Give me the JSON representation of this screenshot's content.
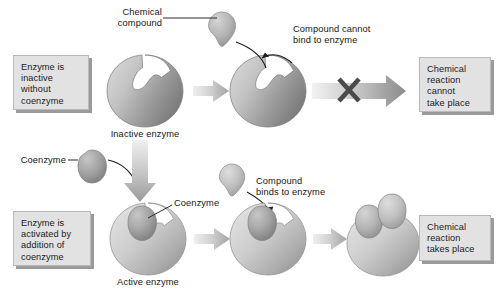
{
  "diagram": {
    "colors": {
      "box_fill": "#e2e2e2",
      "box_border": "#b9b9b9",
      "box_shadow": "#9a9a9a",
      "enzyme_light": "#d8d8d8",
      "enzyme_dark": "#8d8d8d",
      "coenzyme_dark": "#9c9c9c",
      "compound_gray": "#b5b5b5",
      "arrow_light": "#eeeeee",
      "arrow_dark": "#8a8a8a",
      "cross_mark": "#4d4d4d",
      "text": "#171717",
      "background": "#ffffff"
    },
    "top_row": {
      "left_box": "Enzyme is\ninactive\nwithout\ncoenzyme",
      "compound_label": "Chemical\ncompound",
      "enzyme_caption": "Inactive enzyme",
      "result_annotation": "Compound cannot\nbind to enzyme",
      "right_box": "Chemical\nreaction\ncannot\ntake place",
      "blocked_marker": "X"
    },
    "bottom_row": {
      "left_box": "Enzyme is\nactivated by\naddition of\ncoenzyme",
      "coenzyme_label": "Coenzyme",
      "coenzyme_bound_label": "Coenzyme",
      "enzyme_caption": "Active enzyme",
      "result_annotation": "Compound\nbinds to enzyme",
      "right_box": "Chemical\nreaction\ntakes place"
    }
  }
}
